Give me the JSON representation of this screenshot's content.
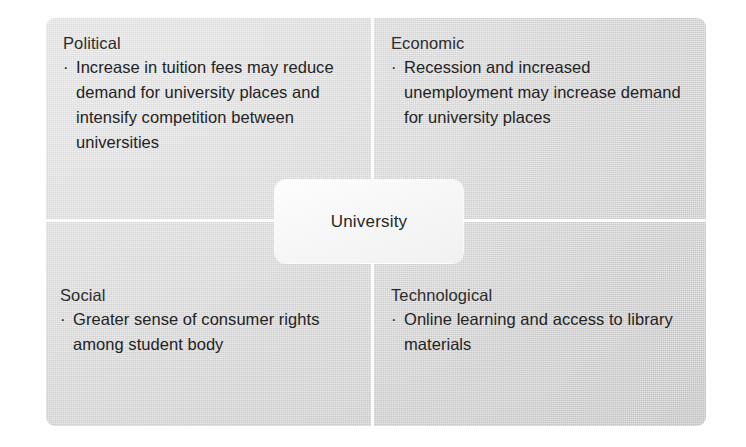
{
  "figure": {
    "type": "pest-analysis",
    "center": {
      "label": "University"
    },
    "colors": {
      "panel_background": "#d2d2d2",
      "divider": "#fdfdfd",
      "center_box": "#f7f7f7",
      "text": "#232323",
      "heading_text": "#2c2c2c"
    },
    "bullet_marker": "·",
    "quadrants": [
      {
        "key": "political",
        "position": "top-left",
        "heading": "Political",
        "bullets": [
          "Increase in tuition fees may reduce demand for university places and intensify competition between universities"
        ]
      },
      {
        "key": "economic",
        "position": "top-right",
        "heading": "Economic",
        "bullets": [
          "Recession and increased unemployment may increase demand for university places"
        ]
      },
      {
        "key": "social",
        "position": "bottom-left",
        "heading": "Social",
        "bullets": [
          "Greater sense of consumer rights among student body"
        ]
      },
      {
        "key": "technological",
        "position": "bottom-right",
        "heading": "Technological",
        "bullets": [
          "Online learning and access to library materials"
        ]
      }
    ]
  }
}
